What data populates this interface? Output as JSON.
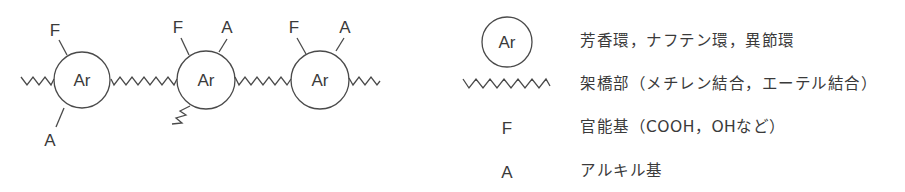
{
  "diagram": {
    "title": "",
    "nodes": [
      {
        "id": "ring1",
        "label": "Ar",
        "substituents": [
          {
            "label": "F",
            "position": "top-left"
          },
          {
            "label": "A",
            "position": "bottom-left"
          }
        ]
      },
      {
        "id": "ring2",
        "label": "Ar",
        "substituents": [
          {
            "label": "F",
            "position": "top-left"
          },
          {
            "label": "A",
            "position": "top-right"
          },
          {
            "label": "",
            "position": "bottom-left-bridge"
          }
        ]
      },
      {
        "id": "ring3",
        "label": "Ar",
        "substituents": [
          {
            "label": "F",
            "position": "top-left"
          },
          {
            "label": "A",
            "position": "top-right"
          }
        ]
      }
    ],
    "labels": {
      "ring1": "Ar",
      "ring2": "Ar",
      "ring3": "Ar",
      "r1_f": "F",
      "r1_a": "A",
      "r2_f": "F",
      "r2_a": "A",
      "r3_f": "F",
      "r3_a": "A"
    }
  },
  "legend": {
    "items": [
      {
        "symbol": "Ar",
        "symbol_type": "circle",
        "text": "芳香環，ナフテン環，異節環"
      },
      {
        "symbol": "",
        "symbol_type": "zigzag",
        "text": "架橋部（メチレン結合，エーテル結合）"
      },
      {
        "symbol": "F",
        "symbol_type": "letter",
        "text": "官能基（COOH，OHなど）"
      },
      {
        "symbol": "A",
        "symbol_type": "letter",
        "text": "アルキル基"
      }
    ]
  },
  "colors": {
    "stroke": "#4a4a4a",
    "text": "#3a3a3a",
    "background": "#ffffff"
  }
}
